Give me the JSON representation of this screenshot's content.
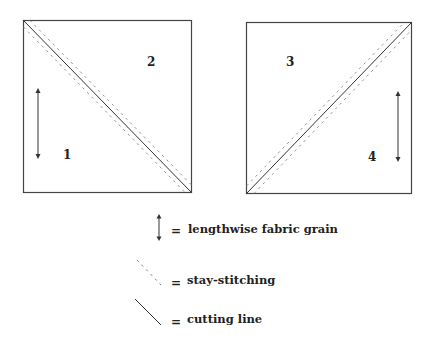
{
  "squares": [
    {
      "id": "left",
      "diagonal": "top-left to bottom-right",
      "pieces": [
        {
          "number": "1",
          "grain_arrow": true
        },
        {
          "number": "2",
          "grain_arrow": false
        }
      ]
    },
    {
      "id": "right",
      "diagonal": "bottom-left to top-right",
      "pieces": [
        {
          "number": "3",
          "grain_arrow": false
        },
        {
          "number": "4",
          "grain_arrow": true
        }
      ]
    }
  ],
  "legend": {
    "equals": "=",
    "items": [
      {
        "symbol": "double-arrow-icon",
        "label": "lengthwise fabric grain"
      },
      {
        "symbol": "dashed-line-icon",
        "label": "stay-stitching"
      },
      {
        "symbol": "solid-line-icon",
        "label": "cutting line"
      }
    ]
  },
  "colors": {
    "line": "#333333",
    "dash": "#777777",
    "background": "#ffffff"
  }
}
